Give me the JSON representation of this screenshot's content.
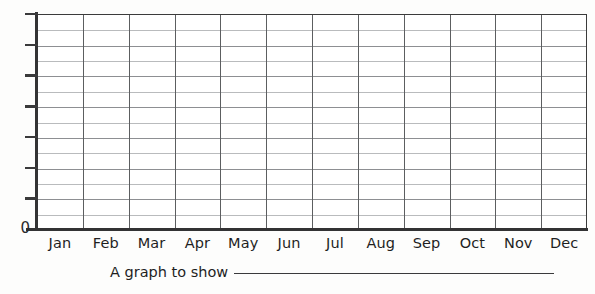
{
  "page": {
    "background_color": "#fdfdfc",
    "ink_color": "#1f1f1f"
  },
  "caption": {
    "text": "A graph to show",
    "blank_line": true
  },
  "axes": {
    "y_origin_label": "0",
    "y_tick_count": 8,
    "y_tick_labels": [
      "",
      "",
      "",
      "",
      "",
      "",
      "",
      "0"
    ],
    "x_tick_count": 12
  },
  "chart_data": {
    "type": "bar",
    "title": "A graph to show",
    "xlabel": "",
    "ylabel": "",
    "categories": [
      "Jan",
      "Feb",
      "Mar",
      "Apr",
      "May",
      "Jun",
      "Jul",
      "Aug",
      "Sep",
      "Oct",
      "Nov",
      "Dec"
    ],
    "values": [
      0,
      0,
      0,
      0,
      0,
      0,
      0,
      0,
      0,
      0,
      0,
      0
    ],
    "ylim": [
      0,
      14
    ],
    "yticks": [
      0,
      2,
      4,
      6,
      8,
      10,
      12,
      14
    ],
    "ytick_labels": [
      "0",
      "",
      "",
      "",
      "",
      "",
      "",
      ""
    ],
    "grid": true,
    "grid_horizontal_lines": 14,
    "grid_vertical_lines": 12,
    "legend": null
  },
  "colors": {
    "axis": "#333334",
    "gridline_major": "#8d8f92",
    "gridline_minor": "#b9bbbd",
    "gridline_vertical": "#5c5e60",
    "paper": "#fdfdfc"
  }
}
